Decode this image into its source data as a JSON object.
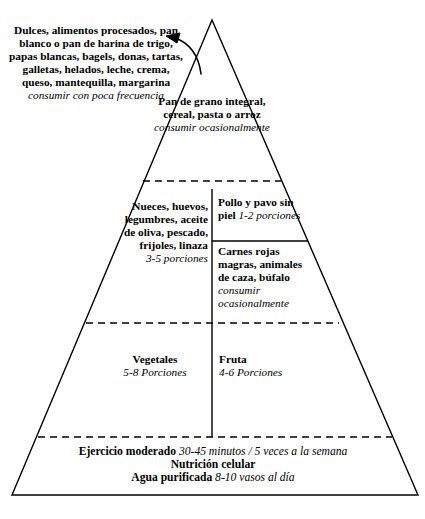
{
  "diagram": {
    "type": "food-pyramid",
    "stroke_color": "#000000",
    "background_color": "#ffffff",
    "text_color": "#000000"
  },
  "callout": {
    "label": "Dulces, alimentos procesados, pan blanco o pan de harina de trigo, papas blancas, bagels, donas, tartas, galletas, helados, leche, crema, queso, mantequilla, margarina",
    "note": "consumir con poca frecuencia"
  },
  "tiers": {
    "grains": {
      "label": "Pan de grano integral, cereal, pasta o arroz",
      "note": "consumir ocasionalmente"
    },
    "nuts": {
      "label": "Nueces, huevos, legumbres, aceite de oliva, pescado, frijoles, linaza",
      "note": "3-5 porciones"
    },
    "poultry": {
      "label": "Pollo y pavo sin piel ",
      "note": "1-2 porciones"
    },
    "red_meat": {
      "label": "Carnes rojas magras, animales de caza, búfalo",
      "note": "consumir ocasionalmente"
    },
    "vegetables": {
      "label": "Vegetales",
      "note": "5-8 Porciones"
    },
    "fruit": {
      "label": "Fruta",
      "note": "4-6 Porciones"
    }
  },
  "base": {
    "exercise_label": "Ejercicio moderado ",
    "exercise_note": "30-45 minutos / 5 veces a la semana",
    "nutrition_label": "Nutrición celular",
    "water_label": "Agua purificada ",
    "water_note": "8-10 vasos al día"
  }
}
